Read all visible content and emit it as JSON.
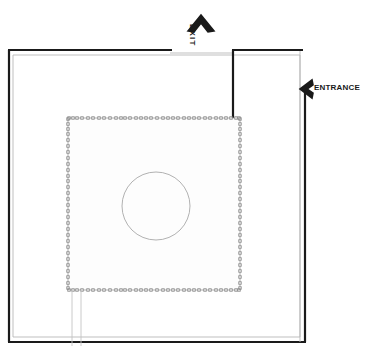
{
  "plan": {
    "title": "Architectural Floor Plan",
    "canvas": {
      "width": 366,
      "height": 356
    },
    "colors": {
      "wall_outline": "#1a1a1a",
      "wall_inner": "#b8b8b8",
      "courtyard_outline": "#9a9a9a",
      "marker": "#8a8a8a",
      "circle": "#a8a8a8",
      "background": "#ffffff",
      "label": "#1a1a1a"
    },
    "labels": {
      "exit": "EXIT",
      "entrance": "ENTRANCE"
    },
    "markers": {
      "exit_arrow": "chevron-up-icon",
      "entrance_arrow": "chevron-left-icon"
    },
    "geometry": {
      "outer_wall": {
        "left": 8,
        "top": 50,
        "right": 306,
        "bottom": 342,
        "inner_offset": 5,
        "thick_width": 2.2,
        "thin_width": 0.8
      },
      "top_wall_left_segment": {
        "x1": 8,
        "x2": 172,
        "y": 50
      },
      "top_wall_right_segment": {
        "x1": 233,
        "x2": 303,
        "y": 50
      },
      "top_wall_gap_line": {
        "x1": 172,
        "x2": 233,
        "y": 53
      },
      "interior_vertical_wall": {
        "x": 233,
        "y1": 50,
        "y2": 118
      },
      "right_wall_lower_thick": {
        "x": 305,
        "y1": 92,
        "y2": 342
      },
      "right_wall_upper_thin": {
        "x": 300,
        "y1": 51,
        "y2": 342
      },
      "courtyard": {
        "left": 68,
        "top": 118,
        "right": 240,
        "bottom": 290
      },
      "center_circle": {
        "cx": 156,
        "cy": 206,
        "r": 34
      },
      "drop_lines": [
        {
          "x": 72,
          "y1": 290,
          "y2": 345
        },
        {
          "x": 81,
          "y1": 290,
          "y2": 345
        }
      ]
    },
    "courtyard_markers": {
      "description": "small square column markers along courtyard perimeter",
      "size": 2.6,
      "top_edge_x": [
        69,
        73,
        77,
        82,
        88,
        93,
        99,
        104,
        110,
        116,
        121,
        125,
        130,
        136,
        141,
        146,
        151,
        157,
        163,
        168,
        173,
        178,
        184,
        189,
        194,
        199,
        205,
        210,
        216,
        221,
        226,
        231,
        236,
        239
      ],
      "bottom_edge_x": [
        69,
        73,
        77,
        82,
        88,
        93,
        99,
        104,
        110,
        116,
        121,
        125,
        130,
        136,
        141,
        146,
        151,
        157,
        163,
        168,
        173,
        178,
        184,
        189,
        194,
        199,
        205,
        210,
        216,
        221,
        226,
        231,
        236,
        239
      ],
      "left_edge_y": [
        119,
        124,
        129,
        134,
        140,
        146,
        152,
        158,
        164,
        170,
        176,
        181,
        187,
        193,
        199,
        205,
        211,
        217,
        223,
        229,
        235,
        241,
        247,
        253,
        259,
        265,
        271,
        277,
        283,
        288
      ],
      "right_edge_y": [
        119,
        124,
        129,
        134,
        140,
        146,
        152,
        158,
        164,
        170,
        176,
        181,
        187,
        193,
        199,
        205,
        211,
        217,
        223,
        229,
        235,
        241,
        247,
        253,
        259,
        265,
        271,
        277,
        283,
        288
      ]
    }
  }
}
